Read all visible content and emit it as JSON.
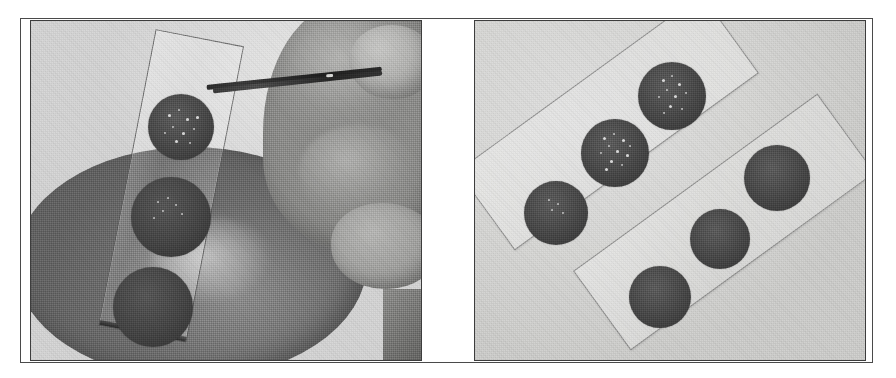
{
  "figure": {
    "kind": "scanned-halftone-photograph",
    "panel_count": 2,
    "alt_left": "Gloved-free hand holding fine forceps above a tilted glass microscope slide bearing three dark circular discs, resting over a grey petri dish.",
    "alt_right": "Two glass microscope slides lying diagonally, each carrying three dark circular discs.",
    "background_color": "#ffffff",
    "frame_color": "#4a4a4a",
    "panel_border_color": "#3d3d3d"
  },
  "panels": [
    {
      "id": "panel-left",
      "name": "left-photograph",
      "label": "",
      "scene": {
        "petri_dish": {
          "name": "petri-dish",
          "tone": "#6d6d6d"
        },
        "slide": {
          "name": "glass-slide",
          "rotation_deg": 11,
          "disc_count": 3
        },
        "hand": {
          "name": "hand",
          "tone": "#a0a09e"
        },
        "forceps": {
          "name": "forceps",
          "tone": "#2a2a2a"
        }
      },
      "discs": [
        {
          "name": "disc-top",
          "cx": 150,
          "cy": 106,
          "r": 33,
          "tone": "#444444",
          "speckled": true
        },
        {
          "name": "disc-middle",
          "cx": 140,
          "cy": 196,
          "r": 40,
          "tone": "#3f3f3f",
          "speckled": true
        },
        {
          "name": "disc-bottom",
          "cx": 122,
          "cy": 286,
          "r": 40,
          "tone": "#3c3c3c",
          "speckled": false
        }
      ]
    },
    {
      "id": "panel-right",
      "name": "right-photograph",
      "label": "",
      "scene": {
        "slide_a": {
          "name": "glass-slide-upper",
          "rotation_deg": -36,
          "disc_count": 3
        },
        "slide_b": {
          "name": "glass-slide-lower",
          "rotation_deg": -36,
          "disc_count": 3
        }
      },
      "discs": [
        {
          "name": "disc-a1",
          "cx": 197,
          "cy": 75,
          "r": 34,
          "tone": "#474747",
          "speckled": true
        },
        {
          "name": "disc-a2",
          "cx": 140,
          "cy": 132,
          "r": 34,
          "tone": "#454545",
          "speckled": true
        },
        {
          "name": "disc-a3",
          "cx": 81,
          "cy": 192,
          "r": 32,
          "tone": "#454545",
          "speckled": true
        },
        {
          "name": "disc-b1",
          "cx": 302,
          "cy": 157,
          "r": 33,
          "tone": "#464646",
          "speckled": false
        },
        {
          "name": "disc-b2",
          "cx": 245,
          "cy": 218,
          "r": 30,
          "tone": "#464646",
          "speckled": false
        },
        {
          "name": "disc-b3",
          "cx": 185,
          "cy": 276,
          "r": 31,
          "tone": "#464646",
          "speckled": false
        }
      ]
    }
  ]
}
